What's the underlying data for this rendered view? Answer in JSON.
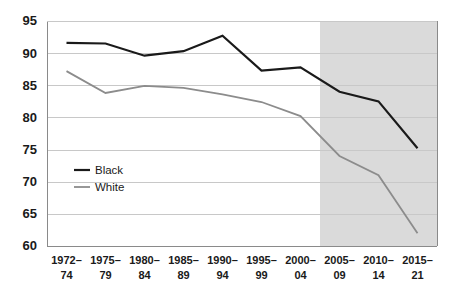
{
  "chart_data": {
    "type": "line",
    "title": "",
    "subtitle": "",
    "xlabel": "",
    "ylabel": "",
    "categories": [
      "1972–\n74",
      "1975–\n79",
      "1980–\n84",
      "1985–\n89",
      "1990–\n94",
      "1995–\n99",
      "2000–\n04",
      "2005–\n09",
      "2010–\n14",
      "2015–\n21"
    ],
    "categories_line1": [
      "1972–",
      "1975–",
      "1980–",
      "1985–",
      "1990–",
      "1995–",
      "2000–",
      "2005–",
      "2010–",
      "2015–"
    ],
    "categories_line2": [
      "74",
      "79",
      "84",
      "89",
      "94",
      "99",
      "04",
      "09",
      "14",
      "21"
    ],
    "series": [
      {
        "name": "Black",
        "color": "#1a1a1a",
        "width": 2.2,
        "values": [
          91.6,
          91.5,
          89.6,
          90.3,
          92.7,
          87.3,
          87.8,
          84.0,
          82.5,
          75.2
        ]
      },
      {
        "name": "White",
        "color": "#8c8c8c",
        "width": 1.8,
        "values": [
          87.2,
          83.8,
          84.9,
          84.6,
          83.6,
          82.4,
          80.2,
          74.0,
          71.0,
          62.0
        ]
      }
    ],
    "yticks": [
      60,
      65,
      70,
      75,
      80,
      85,
      90,
      95
    ],
    "ylim": [
      60,
      95
    ],
    "grid": true,
    "legend_position": "inside-left",
    "shaded_region": {
      "label": "",
      "start_category_index": 6.5,
      "end_category_index": 9.5
    }
  },
  "legend": {
    "items": [
      {
        "label": "Black",
        "color": "#1a1a1a"
      },
      {
        "label": "White",
        "color": "#8c8c8c"
      }
    ]
  },
  "colors": {
    "black_series": "#1a1a1a",
    "white_series": "#8c8c8c",
    "gridline": "#c8c8c8",
    "shade": "#d4d4d4",
    "background": "#ffffff",
    "text": "#1a1a1a"
  }
}
